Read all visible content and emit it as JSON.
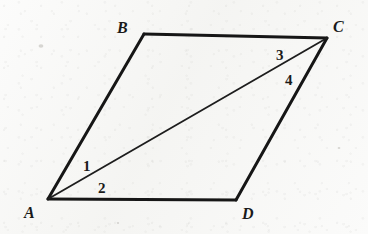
{
  "figure": {
    "kind": "parallelogram-with-diagonal",
    "title": "Parallelogram ABCD with diagonal AC",
    "background_color": "#f6f6f4",
    "ink_color": "#161616",
    "canvas": {
      "width": 368,
      "height": 234
    },
    "vertices": [
      {
        "id": "A",
        "label": "A",
        "x": 48,
        "y": 199,
        "label_x": 24,
        "label_y": 218
      },
      {
        "id": "B",
        "label": "B",
        "x": 144,
        "y": 34,
        "label_x": 117,
        "label_y": 33
      },
      {
        "id": "C",
        "label": "C",
        "x": 327,
        "y": 38,
        "label_x": 333,
        "label_y": 32
      },
      {
        "id": "D",
        "label": "D",
        "x": 236,
        "y": 200,
        "label_x": 242,
        "label_y": 219
      }
    ],
    "sides": [
      {
        "id": "AB",
        "from": "A",
        "to": "B",
        "stroke_width": 3.0
      },
      {
        "id": "BC",
        "from": "B",
        "to": "C",
        "stroke_width": 3.0
      },
      {
        "id": "CD",
        "from": "C",
        "to": "D",
        "stroke_width": 3.0
      },
      {
        "id": "DA",
        "from": "D",
        "to": "A",
        "stroke_width": 3.0
      }
    ],
    "diagonal": {
      "id": "AC",
      "from": "A",
      "to": "C",
      "stroke_width": 1.8
    },
    "angle_labels": [
      {
        "id": "angle-1",
        "label": "1",
        "x": 83,
        "y": 171,
        "at_vertex": "A",
        "between": [
          "AB",
          "AC"
        ]
      },
      {
        "id": "angle-2",
        "label": "2",
        "x": 98,
        "y": 193,
        "at_vertex": "A",
        "between": [
          "AC",
          "AD"
        ]
      },
      {
        "id": "angle-3",
        "label": "3",
        "x": 276,
        "y": 60,
        "at_vertex": "C",
        "between": [
          "CB",
          "CA"
        ]
      },
      {
        "id": "angle-4",
        "label": "4",
        "x": 285,
        "y": 85,
        "at_vertex": "C",
        "between": [
          "CA",
          "CD"
        ]
      }
    ],
    "specks": [
      {
        "id": "speck-1",
        "x": 41,
        "y": 46,
        "rx": 2.4,
        "ry": 1.8
      },
      {
        "id": "speck-2",
        "x": 339,
        "y": 148,
        "rx": 1.3,
        "ry": 1.0
      },
      {
        "id": "speck-3",
        "x": 118,
        "y": 223,
        "rx": 1.1,
        "ry": 0.9
      }
    ]
  }
}
